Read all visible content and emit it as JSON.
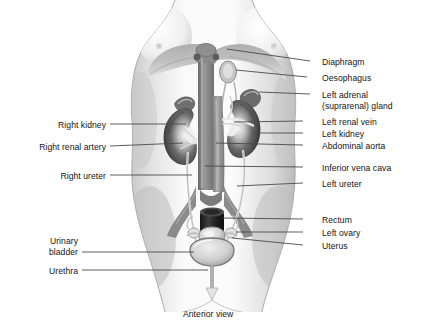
{
  "figure": {
    "caption": "Anterior view",
    "view_title": "Anterior view",
    "colors": {
      "background": "#ffffff",
      "text": "#141414",
      "leader_line": "#4a4a4a",
      "body_light": "#f2f2f2",
      "body_mid": "#d9d9d9",
      "body_shadow": "#bdbdbd",
      "vessel": "#8e8e8e",
      "vessel_dark": "#6f6f6f",
      "kidney_dark": "#4f4f4f",
      "kidney_mid": "#7d7d7d",
      "organ_light": "#e8e8e8",
      "rectum_dark": "#2b2b2b"
    }
  },
  "labels_right": [
    {
      "id": "diaphragm",
      "text": "Diaphragm",
      "text2": "",
      "x": 322,
      "y": 57,
      "line_x1": 310,
      "line_x2": 318,
      "line_y": 61,
      "target_x": 227,
      "target_y": 49
    },
    {
      "id": "oesophagus",
      "text": "Oesophagus",
      "text2": "",
      "x": 322,
      "y": 73,
      "line_x1": 307,
      "line_x2": 318,
      "line_y": 77,
      "target_x": 226,
      "target_y": 70
    },
    {
      "id": "left-adrenal",
      "text": "Left adrenal",
      "text2": "(suprarenal) gland",
      "x": 322,
      "y": 90,
      "line_x1": 310,
      "line_x2": 318,
      "line_y": 94,
      "target_x": 231,
      "target_y": 85
    },
    {
      "id": "left-renal-vein",
      "text": "Left renal vein",
      "text2": "",
      "x": 322,
      "y": 117,
      "line_x1": 303,
      "line_x2": 318,
      "line_y": 121,
      "target_x": 232,
      "target_y": 122
    },
    {
      "id": "left-kidney",
      "text": "Left kidney",
      "text2": "",
      "x": 322,
      "y": 129,
      "line_x1": 303,
      "line_x2": 318,
      "line_y": 133,
      "target_x": 240,
      "target_y": 133
    },
    {
      "id": "abdominal-aorta",
      "text": "Abdominal aorta",
      "text2": "",
      "x": 322,
      "y": 141,
      "line_x1": 303,
      "line_x2": 318,
      "line_y": 145,
      "target_x": 216,
      "target_y": 144
    },
    {
      "id": "inferior-vena-cava",
      "text": "Inferior vena cava",
      "text2": "",
      "x": 322,
      "y": 163,
      "line_x1": 303,
      "line_x2": 318,
      "line_y": 167,
      "target_x": 203,
      "target_y": 166
    },
    {
      "id": "left-ureter",
      "text": "Left ureter",
      "text2": "",
      "x": 322,
      "y": 179,
      "line_x1": 303,
      "line_x2": 318,
      "line_y": 183,
      "target_x": 230,
      "target_y": 182
    },
    {
      "id": "rectum",
      "text": "Rectum",
      "text2": "",
      "x": 322,
      "y": 215,
      "line_x1": 303,
      "line_x2": 318,
      "line_y": 219,
      "target_x": 222,
      "target_y": 218
    },
    {
      "id": "left-ovary",
      "text": "Left ovary",
      "text2": "",
      "x": 322,
      "y": 228,
      "line_x1": 303,
      "line_x2": 318,
      "line_y": 232,
      "target_x": 228,
      "target_y": 231
    },
    {
      "id": "uterus",
      "text": "Uterus",
      "text2": "",
      "x": 322,
      "y": 241,
      "line_x1": 303,
      "line_x2": 318,
      "line_y": 245,
      "target_x": 218,
      "target_y": 238
    }
  ],
  "labels_left": [
    {
      "id": "right-kidney",
      "text": "Right kidney",
      "text2": "",
      "x": 30,
      "y": 120,
      "line_x1": 110,
      "line_x2": 185,
      "line_y": 124,
      "target_x": 185,
      "target_y": 124
    },
    {
      "id": "right-renal-artery",
      "text": "Right renal artery",
      "text2": "",
      "x": 14,
      "y": 142,
      "line_x1": 110,
      "line_x2": 178,
      "line_y": 146,
      "target_x": 178,
      "target_y": 146
    },
    {
      "id": "right-ureter",
      "text": "Right ureter",
      "text2": "",
      "x": 30,
      "y": 171,
      "line_x1": 110,
      "line_x2": 196,
      "line_y": 175,
      "target_x": 196,
      "target_y": 175
    },
    {
      "id": "urinary-bladder",
      "text": "Urinary",
      "text2": "bladder",
      "x": 36,
      "y": 236,
      "line_x1": 82,
      "line_x2": 192,
      "line_y": 252,
      "target_x": 192,
      "target_y": 252
    },
    {
      "id": "urethra",
      "text": "Urethra",
      "text2": "",
      "x": 36,
      "y": 266,
      "line_x1": 82,
      "line_x2": 198,
      "line_y": 270,
      "target_x": 198,
      "target_y": 270
    }
  ],
  "anatomy_parts": [
    "torso-silhouette",
    "left-breast",
    "right-breast",
    "diaphragm-dome",
    "oesophagus-opening",
    "abdominal-aorta",
    "inferior-vena-cava",
    "left-adrenal-gland",
    "right-adrenal-gland",
    "left-kidney",
    "right-kidney",
    "left-renal-vein",
    "right-renal-artery",
    "left-ureter",
    "right-ureter",
    "common-iliac-vessels",
    "rectum",
    "uterus",
    "left-ovary",
    "right-ovary",
    "urinary-bladder",
    "urethra"
  ]
}
